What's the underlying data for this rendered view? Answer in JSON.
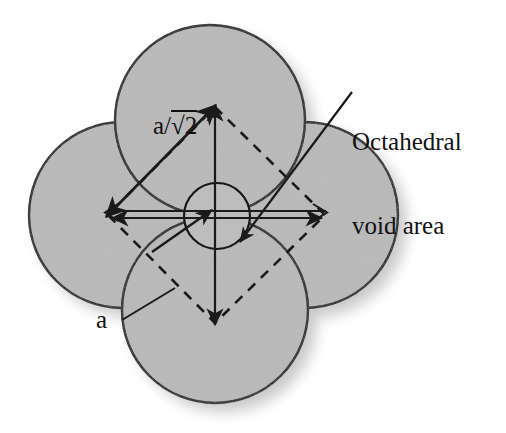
{
  "figure": {
    "background_color": "#ffffff",
    "sphere_fill": "#b8b8b8",
    "sphere_stroke": "#1a1a1a",
    "void_fill": "#b8b8b8",
    "line_color": "#1a1a1a",
    "shadow_color": "#9a9a9a"
  },
  "labels": {
    "octahedral_void": {
      "line1": "Octahedral",
      "line2": "void area",
      "full_text": "Octahedral void area"
    },
    "diagonal_length": {
      "base": "a/",
      "radical": "√2",
      "full_text": "a/√2"
    },
    "edge_length": {
      "text": "a"
    }
  },
  "geometry": {
    "spheres": [
      {
        "name": "top-sphere",
        "cx": 210,
        "cy": 120,
        "r": 95
      },
      {
        "name": "left-sphere",
        "cx": 122,
        "cy": 215,
        "r": 93
      },
      {
        "name": "right-sphere",
        "cx": 305,
        "cy": 215,
        "r": 93
      },
      {
        "name": "bottom-sphere",
        "cx": 215,
        "cy": 310,
        "r": 93
      },
      {
        "name": "void-circle",
        "cx": 217,
        "cy": 216,
        "r": 33
      }
    ],
    "dashed_square": {
      "vertices": [
        {
          "name": "top",
          "x": 215,
          "y": 107
        },
        {
          "name": "right",
          "x": 325,
          "y": 215
        },
        {
          "name": "bottom",
          "x": 215,
          "y": 323
        },
        {
          "name": "left",
          "x": 108,
          "y": 215
        }
      ],
      "edge_label": "a"
    },
    "arrows": {
      "diagonal_up_right": {
        "from": [
          108,
          215
        ],
        "to": [
          215,
          107
        ],
        "label": "a/√2"
      },
      "vertical": {
        "from": [
          215,
          107
        ],
        "to": [
          215,
          323
        ]
      },
      "horizontal": {
        "from": [
          108,
          215
        ],
        "to": [
          325,
          215
        ]
      },
      "void_pointer": {
        "from": [
          350,
          95
        ],
        "to": [
          238,
          240
        ]
      },
      "void_inner": {
        "from": [
          150,
          248
        ],
        "to": [
          212,
          208
        ]
      },
      "edge_pointer": {
        "from": [
          120,
          318
        ],
        "to": [
          175,
          290
        ]
      }
    }
  }
}
